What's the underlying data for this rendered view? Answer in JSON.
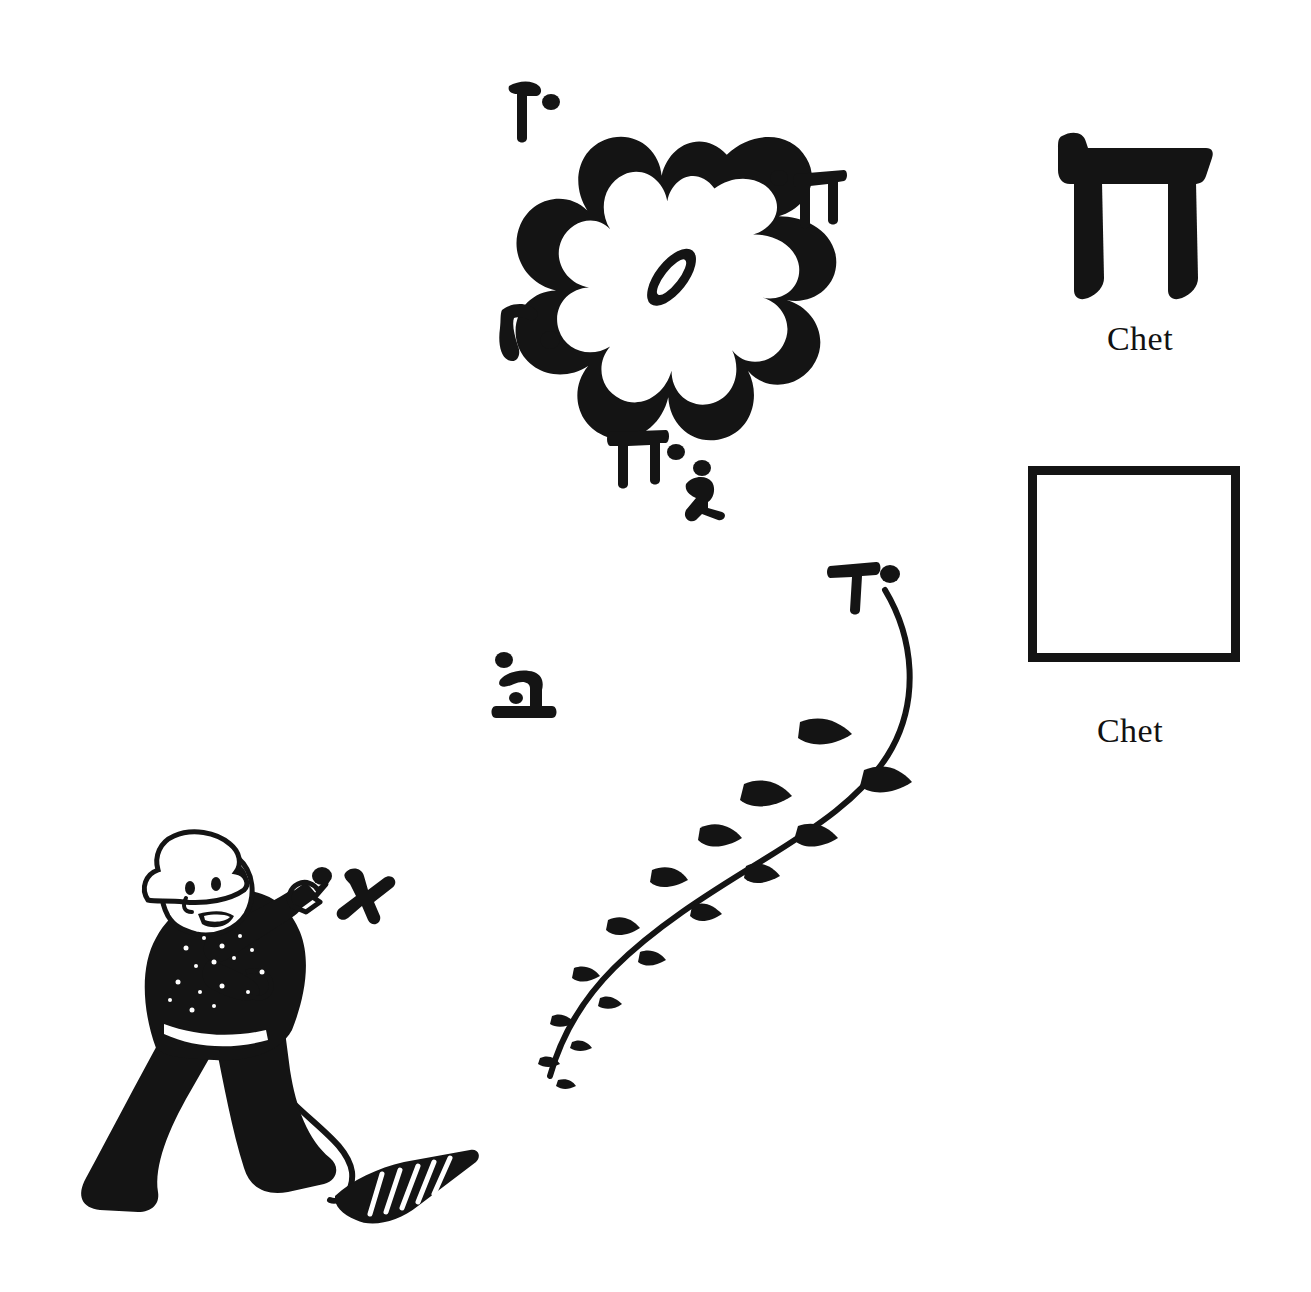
{
  "page": {
    "background_color": "#ffffff",
    "ink_color": "#141414",
    "width": 1311,
    "height": 1292
  },
  "right_column": {
    "specimen": {
      "icon_name": "hebrew-letter-chet-glyph",
      "letter": "ח",
      "label": "Chet"
    },
    "trace_box": {
      "icon_name": "empty-tracing-square",
      "label": "Chet",
      "border_color": "#141414",
      "fill_color": "#ffffff"
    }
  },
  "illustration": {
    "name": "boy-flying-flower-kite",
    "kite": {
      "shape_name": "flower-rosette-kite",
      "petal_count": 8,
      "center_name": "kite-center-oval"
    },
    "kite_tail": {
      "name": "kite-tail-with-bows",
      "bow_count": 12
    },
    "boy": {
      "name": "boy-with-hat-flying-kite",
      "holds": "string-spool"
    },
    "string_spool": {
      "name": "kite-string-spool"
    }
  },
  "scattered_letters": [
    {
      "name": "floating-letter-vav",
      "letter": "ו",
      "romanized": "Vav",
      "dot": true,
      "x": 497,
      "y": 76,
      "size": 58,
      "rotate": -8
    },
    {
      "name": "floating-letter-chet-1",
      "letter": "ח",
      "romanized": "Chet",
      "dot": true,
      "x": 773,
      "y": 166,
      "size": 56,
      "rotate": -6
    },
    {
      "name": "floating-letter-resh",
      "letter": "ר",
      "romanized": "Resh",
      "dot": true,
      "x": 497,
      "y": 300,
      "size": 56,
      "rotate": -14
    },
    {
      "name": "floating-letter-chet-2",
      "letter": "ח",
      "romanized": "Chet",
      "dot": false,
      "x": 610,
      "y": 425,
      "size": 56,
      "rotate": -4
    },
    {
      "name": "floating-letter-gimel",
      "letter": "ג",
      "romanized": "Gimel",
      "dot": true,
      "x": 668,
      "y": 448,
      "size": 58,
      "rotate": -10
    },
    {
      "name": "floating-letter-dalet",
      "letter": "ד",
      "romanized": "Dalet",
      "dot": true,
      "x": 828,
      "y": 555,
      "size": 56,
      "rotate": -6
    },
    {
      "name": "floating-letter-bet",
      "letter": "ב",
      "romanized": "Bet",
      "dot": true,
      "x": 489,
      "y": 652,
      "size": 58,
      "rotate": -4
    },
    {
      "name": "floating-letter-alef",
      "letter": "א",
      "romanized": "Alef",
      "dot": true,
      "x": 318,
      "y": 860,
      "size": 58,
      "rotate": -12
    }
  ]
}
